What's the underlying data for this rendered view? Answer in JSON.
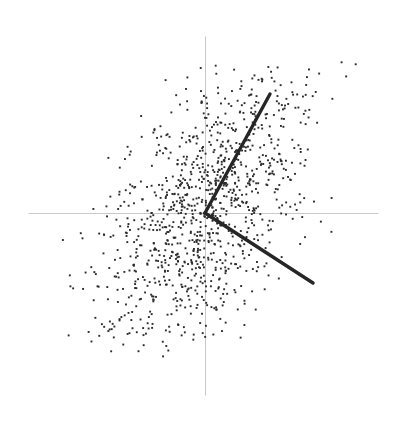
{
  "figure": {
    "width": 399,
    "height": 424,
    "background_color": "#ffffff",
    "title": "",
    "caption": ""
  },
  "chart_data": {
    "type": "scatter",
    "title": "",
    "subtitle": "",
    "xlabel": "",
    "ylabel": "",
    "grid": false,
    "legend": null,
    "legend_position": "none",
    "axes": {
      "origin_px": [
        205,
        213
      ],
      "x_axis": {
        "label": "",
        "tick_labels": [],
        "start_px": [
          28,
          213
        ],
        "end_px": [
          378,
          213
        ],
        "color": "#c8c8c8",
        "width_px": 1
      },
      "y_axis": {
        "label": "",
        "tick_labels": [],
        "start_px": [
          205,
          36
        ],
        "end_px": [
          205,
          395
        ],
        "color": "#c8c8c8",
        "width_px": 1
      },
      "xlim": [
        -1.75,
        1.73
      ],
      "ylim": [
        -1.82,
        1.77
      ]
    },
    "points": {
      "count": 1100,
      "marker": "square-dot",
      "marker_size_px": 1.9,
      "color": "#2b2b2b",
      "distribution": "rotated-gaussian-diamond",
      "center": [
        0.0,
        0.0
      ],
      "major_axis_sd": 0.82,
      "minor_axis_sd": 0.42,
      "rotation_deg": 62,
      "bounds_px": {
        "left": 62,
        "right": 356,
        "top": 62,
        "bottom": 357
      },
      "random_seed": 20240517
    },
    "vectors": [
      {
        "name": "principal-component-1",
        "label": "",
        "start_px": [
          205,
          213
        ],
        "end_px": [
          270,
          94
        ],
        "angle_deg": 61.3,
        "length_px": 135.6,
        "color": "#262626",
        "width_px": 3.4
      },
      {
        "name": "principal-component-2",
        "label": "",
        "start_px": [
          205,
          213
        ],
        "end_px": [
          313,
          283
        ],
        "angle_deg": -32.9,
        "length_px": 128.7,
        "color": "#262626",
        "width_px": 3.4
      }
    ]
  }
}
